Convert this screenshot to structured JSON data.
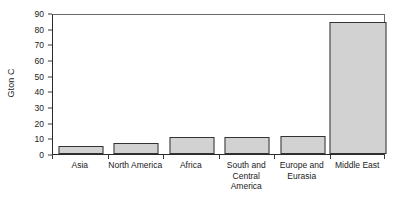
{
  "chart_data": {
    "type": "bar",
    "title": "",
    "subtitle": "",
    "xlabel": "",
    "ylabel": "Gton C",
    "categories": [
      "Asia",
      "North America",
      "Africa",
      "South and Central America",
      "Europe and Eurasia",
      "Middle East"
    ],
    "values": [
      5,
      7,
      11,
      11,
      11.5,
      84
    ],
    "ylim": [
      0,
      90
    ],
    "ytick_labels": [
      "0",
      "10",
      "20",
      "30",
      "40",
      "50",
      "60",
      "70",
      "80",
      "90"
    ],
    "ytick_values": [
      0,
      10,
      20,
      30,
      40,
      50,
      60,
      70,
      80,
      90
    ],
    "ytick_step": 10,
    "grid": false,
    "legend": null,
    "legend_position": "none",
    "bar_fill_color": "#d2d2d2",
    "bar_edge_color": "#333333",
    "axis_color": "#2b2b2b",
    "text_color": "#1a1a1a",
    "background_color": "#ffffff",
    "annotations": []
  }
}
